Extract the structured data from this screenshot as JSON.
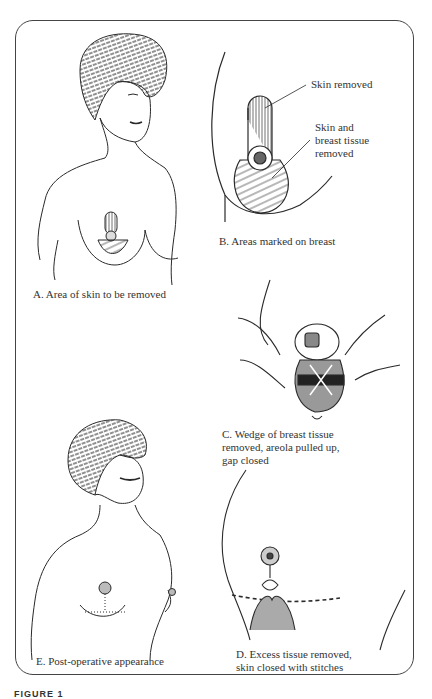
{
  "figure": {
    "label": "FIGURE 1",
    "panels": [
      {
        "id": "A",
        "caption": "A. Area of skin to be removed"
      },
      {
        "id": "B",
        "caption": "B. Areas marked on breast",
        "annotations": [
          "Skin removed",
          "Skin and",
          "breast tissue",
          "removed"
        ]
      },
      {
        "id": "C",
        "caption_lines": [
          "C. Wedge of breast tissue",
          "removed, areola pulled up,",
          "gap closed"
        ]
      },
      {
        "id": "D",
        "caption_lines": [
          "D. Excess tissue removed,",
          "skin closed with stitches"
        ]
      },
      {
        "id": "E",
        "caption": "E. Post-operative appearance"
      }
    ]
  },
  "colors": {
    "ink": "#2a2a2a",
    "background": "#ffffff",
    "border": "#444444"
  }
}
